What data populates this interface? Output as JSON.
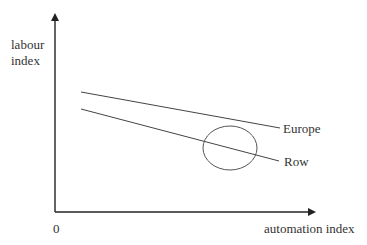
{
  "diagram": {
    "y_axis_label_line1": "labour",
    "y_axis_label_line2": "index",
    "x_axis_label": "automation index",
    "origin_label": "0",
    "lines": [
      {
        "name": "Europe",
        "label": "Europe"
      },
      {
        "name": "Row",
        "label": "Row"
      }
    ],
    "highlight": "ellipse around Row line crossing region",
    "colors": {
      "line": "#444444",
      "axis": "#222222",
      "ellipse": "#555555"
    }
  }
}
